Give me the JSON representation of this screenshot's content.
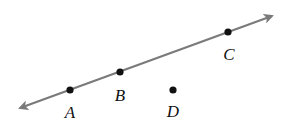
{
  "diagram": {
    "type": "geometry-line-with-points",
    "line": {
      "start": [
        20,
        108
      ],
      "end": [
        272,
        16
      ],
      "color": "#7a7a7a",
      "arrows": "both"
    },
    "points": [
      {
        "label": "A",
        "x": 70,
        "y": 90,
        "label_x": 70,
        "label_y": 112,
        "on_line": true
      },
      {
        "label": "B",
        "x": 120,
        "y": 72,
        "label_x": 120,
        "label_y": 95,
        "on_line": true
      },
      {
        "label": "C",
        "x": 228,
        "y": 32,
        "label_x": 229,
        "label_y": 54,
        "on_line": true
      },
      {
        "label": "D",
        "x": 173,
        "y": 90,
        "label_x": 173,
        "label_y": 111,
        "on_line": false
      }
    ],
    "point_color": "#111111"
  }
}
